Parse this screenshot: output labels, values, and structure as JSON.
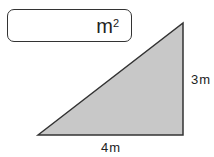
{
  "answer_box": {
    "value": "",
    "unit": "m",
    "unit_exponent": "2"
  },
  "triangle": {
    "height_label": "3m",
    "base_label": "4m",
    "fill": "#c8c8c8",
    "stroke": "#333333"
  }
}
